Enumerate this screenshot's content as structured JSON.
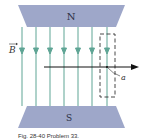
{
  "figure": {
    "north_label": "N",
    "south_label": "S",
    "field_label": "B",
    "point_label": "a",
    "caption": "Fig. 28-40  Problem 33.",
    "colors": {
      "pole": "#9ea7c9",
      "pole_text": "#2a2f45",
      "field_line": "#5fa595",
      "arrow": "#111111",
      "dashed_loop": "#333333"
    },
    "field_lines_x": [
      22,
      36,
      50,
      64,
      78,
      92,
      107
    ]
  }
}
